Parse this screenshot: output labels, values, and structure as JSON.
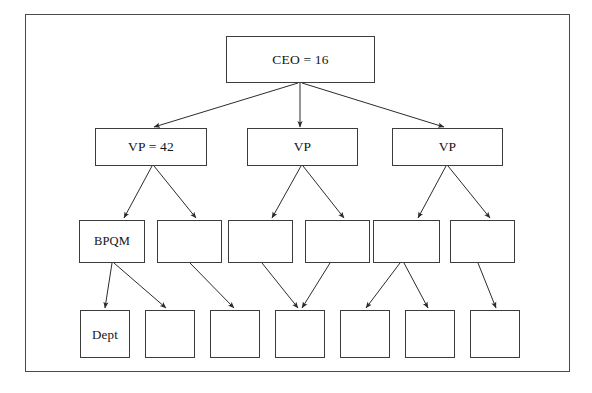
{
  "diagram": {
    "background_color": "#ffffff",
    "border_color": "#4a4a4a",
    "box_border_color": "#3c3c3c",
    "arrow_color": "#2b2b2b",
    "frame": {
      "x": 25,
      "y": 14,
      "width": 545,
      "height": 358
    },
    "levels": [
      {
        "name": "ceo",
        "label": "CEO level"
      },
      {
        "name": "vp",
        "label": "VP level"
      },
      {
        "name": "manager",
        "label": "Manager level"
      },
      {
        "name": "department",
        "label": "Department level"
      }
    ],
    "nodes": [
      {
        "id": "ceo",
        "level": "ceo",
        "label": "CEO = 16",
        "x": 226,
        "y": 36,
        "w": 149,
        "h": 47
      },
      {
        "id": "vp1",
        "level": "vp",
        "label": "VP = 42",
        "x": 95,
        "y": 128,
        "w": 112,
        "h": 38
      },
      {
        "id": "vp2",
        "level": "vp",
        "label": "VP",
        "x": 247,
        "y": 128,
        "w": 111,
        "h": 38
      },
      {
        "id": "vp3",
        "level": "vp",
        "label": "VP",
        "x": 392,
        "y": 128,
        "w": 111,
        "h": 38
      },
      {
        "id": "m1",
        "level": "manager",
        "label": "BPQM",
        "x": 79,
        "y": 220,
        "w": 66,
        "h": 43
      },
      {
        "id": "m2",
        "level": "manager",
        "label": "",
        "x": 157,
        "y": 220,
        "w": 65,
        "h": 43
      },
      {
        "id": "m3",
        "level": "manager",
        "label": "",
        "x": 228,
        "y": 220,
        "w": 65,
        "h": 43
      },
      {
        "id": "m4",
        "level": "manager",
        "label": "",
        "x": 305,
        "y": 220,
        "w": 65,
        "h": 43
      },
      {
        "id": "m5",
        "level": "manager",
        "label": "",
        "x": 373,
        "y": 220,
        "w": 67,
        "h": 43
      },
      {
        "id": "m6",
        "level": "manager",
        "label": "",
        "x": 450,
        "y": 220,
        "w": 65,
        "h": 43
      },
      {
        "id": "d1",
        "level": "department",
        "label": "Dept",
        "x": 80,
        "y": 310,
        "w": 50,
        "h": 48
      },
      {
        "id": "d2",
        "level": "department",
        "label": "",
        "x": 145,
        "y": 310,
        "w": 50,
        "h": 48
      },
      {
        "id": "d3",
        "level": "department",
        "label": "",
        "x": 210,
        "y": 310,
        "w": 50,
        "h": 48
      },
      {
        "id": "d4",
        "level": "department",
        "label": "",
        "x": 275,
        "y": 310,
        "w": 50,
        "h": 48
      },
      {
        "id": "d5",
        "level": "department",
        "label": "",
        "x": 340,
        "y": 310,
        "w": 50,
        "h": 48
      },
      {
        "id": "d6",
        "level": "department",
        "label": "",
        "x": 405,
        "y": 310,
        "w": 50,
        "h": 48
      },
      {
        "id": "d7",
        "level": "department",
        "label": "",
        "x": 470,
        "y": 310,
        "w": 50,
        "h": 48
      }
    ],
    "edges": [
      {
        "from": "ceo",
        "to": "vp1",
        "x1": 298,
        "y1": 83,
        "x2": 154,
        "y2": 127
      },
      {
        "from": "ceo",
        "to": "vp2",
        "x1": 300,
        "y1": 83,
        "x2": 300,
        "y2": 127
      },
      {
        "from": "ceo",
        "to": "vp3",
        "x1": 302,
        "y1": 83,
        "x2": 444,
        "y2": 127
      },
      {
        "from": "vp1",
        "to": "m1",
        "x1": 152,
        "y1": 166,
        "x2": 124,
        "y2": 218
      },
      {
        "from": "vp1",
        "to": "m2",
        "x1": 154,
        "y1": 166,
        "x2": 196,
        "y2": 218
      },
      {
        "from": "vp2",
        "to": "m3",
        "x1": 301,
        "y1": 166,
        "x2": 272,
        "y2": 218
      },
      {
        "from": "vp2",
        "to": "m4",
        "x1": 303,
        "y1": 166,
        "x2": 344,
        "y2": 218
      },
      {
        "from": "vp3",
        "to": "m5",
        "x1": 446,
        "y1": 166,
        "x2": 418,
        "y2": 218
      },
      {
        "from": "vp3",
        "to": "m6",
        "x1": 448,
        "y1": 166,
        "x2": 490,
        "y2": 218
      },
      {
        "from": "m1",
        "to": "d1",
        "x1": 112,
        "y1": 263,
        "x2": 105,
        "y2": 308
      },
      {
        "from": "m1",
        "to": "d2",
        "x1": 114,
        "y1": 263,
        "x2": 166,
        "y2": 308
      },
      {
        "from": "m2",
        "to": "d3",
        "x1": 190,
        "y1": 263,
        "x2": 234,
        "y2": 308
      },
      {
        "from": "m3",
        "to": "d4",
        "x1": 262,
        "y1": 263,
        "x2": 298,
        "y2": 308
      },
      {
        "from": "m4",
        "to": "d4",
        "x1": 330,
        "y1": 263,
        "x2": 302,
        "y2": 308
      },
      {
        "from": "m5",
        "to": "d5",
        "x1": 400,
        "y1": 263,
        "x2": 366,
        "y2": 308
      },
      {
        "from": "m5",
        "to": "d6",
        "x1": 404,
        "y1": 263,
        "x2": 428,
        "y2": 308
      },
      {
        "from": "m6",
        "to": "d7",
        "x1": 478,
        "y1": 263,
        "x2": 496,
        "y2": 308
      }
    ]
  }
}
